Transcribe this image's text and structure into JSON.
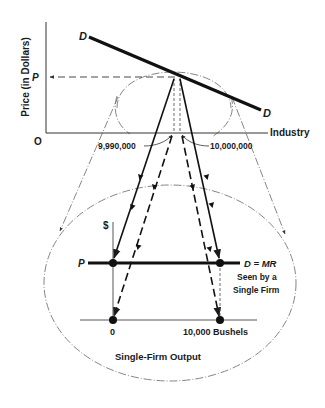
{
  "industry_graph": {
    "y_axis_label": "Price (in Dollars)",
    "x_axis_label": "Industry",
    "origin_label": "O",
    "price_label": "P",
    "demand_label_top": "D",
    "demand_label_bottom": "D",
    "quantity_left": "9,990,000",
    "quantity_right": "10,000,000"
  },
  "firm_graph": {
    "y_axis_label": "$",
    "price_label": "P",
    "demand_label": "D = MR",
    "demand_note_line1": "Seen by a",
    "demand_note_line2": "Single Firm",
    "origin_label": "0",
    "quantity_label": "10,000 Bushels",
    "title": "Single-Firm Output"
  },
  "colors": {
    "ink": "#1a1a1a",
    "faint": "#555555",
    "background": "#ffffff"
  }
}
